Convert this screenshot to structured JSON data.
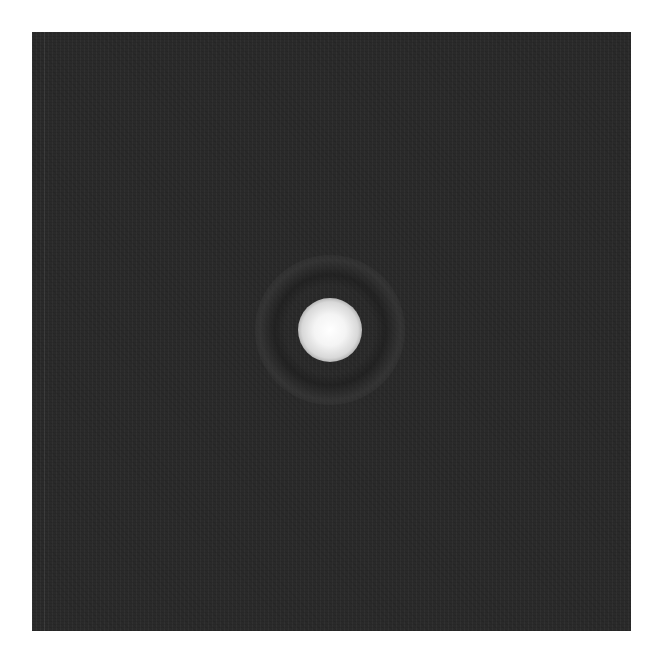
{
  "image": {
    "description": "Diffraction spot (Airy disk) on dark noisy background",
    "background_color": "#2a2a2a",
    "page_background": "#ffffff",
    "spot": {
      "center_x": 330,
      "center_y": 330,
      "core_radius_px": 27,
      "color": "#ffffff"
    },
    "ring": {
      "radius_px": 55,
      "color": "#4a4a4a"
    }
  }
}
